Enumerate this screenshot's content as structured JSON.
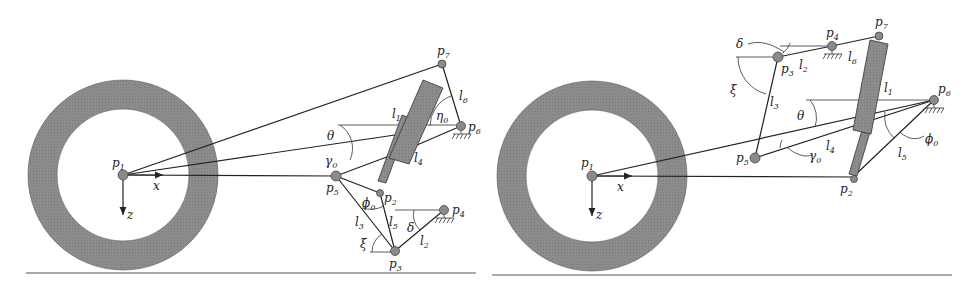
{
  "figures": [
    {
      "id": "left",
      "labels": {
        "p1": "p",
        "p1_sub": "1",
        "p2": "p",
        "p2_sub": "2",
        "p3": "p",
        "p3_sub": "3",
        "p4": "p",
        "p4_sub": "4",
        "p5": "p",
        "p5_sub": "5",
        "p6": "p",
        "p6_sub": "6",
        "p7": "p",
        "p7_sub": "7",
        "l1": "l",
        "l1_sub": "1",
        "l2": "l",
        "l2_sub": "2",
        "l3": "l",
        "l3_sub": "3",
        "l4": "l",
        "l4_sub": "4",
        "l5": "l",
        "l5_sub": "5",
        "l6": "l",
        "l6_sub": "6",
        "theta": "θ",
        "gamma0": "γ",
        "gamma0_sub": "0",
        "phi0": "ϕ",
        "phi0_sub": "0",
        "eta0": "η",
        "eta0_sub": "0",
        "xi": "ξ",
        "delta": "δ",
        "x_axis": "x",
        "z_axis": "z"
      }
    },
    {
      "id": "right",
      "labels": {
        "p1": "p",
        "p1_sub": "1",
        "p2": "p",
        "p2_sub": "2",
        "p3": "p",
        "p3_sub": "3",
        "p4": "p",
        "p4_sub": "4",
        "p5": "p",
        "p5_sub": "5",
        "p6": "p",
        "p6_sub": "6",
        "p7": "p",
        "p7_sub": "7",
        "l1": "l",
        "l1_sub": "1",
        "l2": "l",
        "l2_sub": "2",
        "l3": "l",
        "l3_sub": "3",
        "l4": "l",
        "l4_sub": "4",
        "l5": "l",
        "l5_sub": "5",
        "l6": "l",
        "l6_sub": "6",
        "theta": "θ",
        "gamma0": "γ",
        "gamma0_sub": "0",
        "phi0": "ϕ",
        "phi0_sub": "0",
        "xi": "ξ",
        "delta": "δ",
        "x_axis": "x",
        "z_axis": "z"
      }
    }
  ],
  "colors": {
    "tire": "#8c8c8c",
    "shock": "#8f8f8f",
    "joint": "#8a8a8a",
    "line": "#222222"
  }
}
